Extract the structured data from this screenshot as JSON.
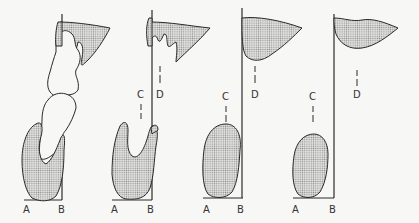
{
  "diagram": {
    "panels": [
      {
        "index": 1,
        "labels": {
          "a": "A",
          "b": "B"
        }
      },
      {
        "index": 2,
        "labels": {
          "a": "A",
          "b": "B",
          "c": "C",
          "d": "D"
        }
      },
      {
        "index": 3,
        "labels": {
          "a": "A",
          "b": "B",
          "c": "C",
          "d": "D"
        }
      },
      {
        "index": 4,
        "labels": {
          "a": "A",
          "b": "B",
          "c": "C",
          "d": "D"
        }
      }
    ],
    "colors": {
      "line": "#2a2a2a",
      "fill_dot": "#9a9a9a",
      "background": "#f7f7f5"
    }
  }
}
